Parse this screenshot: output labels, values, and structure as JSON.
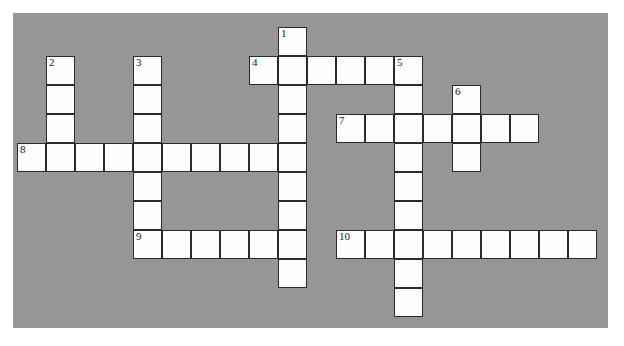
{
  "puzzle": {
    "kind": "crossword-grid",
    "background_color": "#969696",
    "cell_color": "#fdfdfd",
    "cell_border_color": "#2b2b2b",
    "page_color": "#ffffff",
    "cell_size": 29,
    "origin_x": 4,
    "origin_y": 14,
    "columns": 20,
    "rows": 10,
    "entries": [
      {
        "number": "1",
        "direction": "down",
        "row": 0,
        "col": 9,
        "length": 9
      },
      {
        "number": "2",
        "direction": "down",
        "row": 1,
        "col": 1,
        "length": 4
      },
      {
        "number": "3",
        "direction": "down",
        "row": 1,
        "col": 4,
        "length": 6
      },
      {
        "number": "4",
        "direction": "across",
        "row": 1,
        "col": 8,
        "length": 6
      },
      {
        "number": "5",
        "direction": "down",
        "row": 1,
        "col": 13,
        "length": 9
      },
      {
        "number": "6",
        "direction": "down",
        "row": 2,
        "col": 15,
        "length": 3
      },
      {
        "number": "7",
        "direction": "across",
        "row": 3,
        "col": 11,
        "length": 7
      },
      {
        "number": "8",
        "direction": "across",
        "row": 4,
        "col": 0,
        "length": 10
      },
      {
        "number": "9",
        "direction": "across",
        "row": 7,
        "col": 4,
        "length": 6
      },
      {
        "number": "10",
        "direction": "across",
        "row": 7,
        "col": 11,
        "length": 9
      }
    ],
    "numbered_cells": [
      {
        "label": "1",
        "row": 0,
        "col": 9
      },
      {
        "label": "2",
        "row": 1,
        "col": 1
      },
      {
        "label": "3",
        "row": 1,
        "col": 4
      },
      {
        "label": "4",
        "row": 1,
        "col": 8
      },
      {
        "label": "5",
        "row": 1,
        "col": 13
      },
      {
        "label": "6",
        "row": 2,
        "col": 15
      },
      {
        "label": "7",
        "row": 3,
        "col": 11
      },
      {
        "label": "8",
        "row": 4,
        "col": 0
      },
      {
        "label": "9",
        "row": 7,
        "col": 4
      },
      {
        "label": "10",
        "row": 7,
        "col": 11
      }
    ],
    "letters": {}
  }
}
